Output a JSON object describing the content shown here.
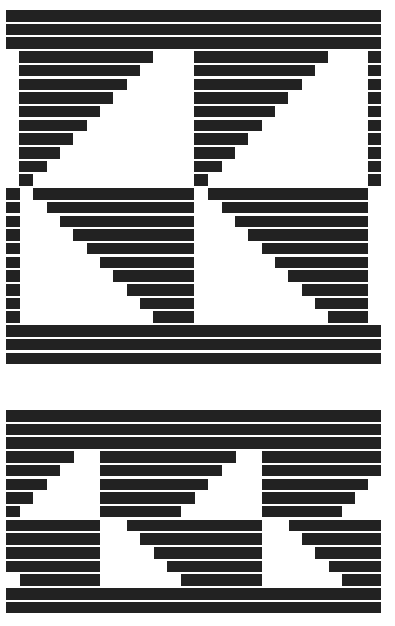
{
  "artwork": {
    "bar_color": "#222222",
    "background": "#ffffff",
    "bar_height": 11.6,
    "row_pitch": 13.7,
    "blocks": [
      {
        "name": "top-pattern",
        "top": 10,
        "rows": [
          [
            [
              6,
              381
            ]
          ],
          [
            [
              6,
              381
            ]
          ],
          [
            [
              6,
              381
            ]
          ],
          [
            [
              19,
              153
            ],
            [
              194,
              328
            ],
            [
              368,
              381
            ]
          ],
          [
            [
              19,
              140
            ],
            [
              194,
              315
            ],
            [
              368,
              381
            ]
          ],
          [
            [
              19,
              127
            ],
            [
              194,
              302
            ],
            [
              368,
              381
            ]
          ],
          [
            [
              19,
              113
            ],
            [
              194,
              288
            ],
            [
              368,
              381
            ]
          ],
          [
            [
              19,
              100
            ],
            [
              194,
              275
            ],
            [
              368,
              381
            ]
          ],
          [
            [
              19,
              87
            ],
            [
              194,
              262
            ],
            [
              368,
              381
            ]
          ],
          [
            [
              19,
              73
            ],
            [
              194,
              248
            ],
            [
              368,
              381
            ]
          ],
          [
            [
              19,
              60
            ],
            [
              194,
              235
            ],
            [
              368,
              381
            ]
          ],
          [
            [
              19,
              47
            ],
            [
              194,
              222
            ],
            [
              368,
              381
            ]
          ],
          [
            [
              19,
              33
            ],
            [
              194,
              208
            ],
            [
              368,
              381
            ]
          ],
          [
            [
              6,
              20
            ],
            [
              33,
              194
            ],
            [
              208,
              368
            ]
          ],
          [
            [
              6,
              20
            ],
            [
              47,
              194
            ],
            [
              222,
              368
            ]
          ],
          [
            [
              6,
              20
            ],
            [
              60,
              194
            ],
            [
              235,
              368
            ]
          ],
          [
            [
              6,
              20
            ],
            [
              73,
              194
            ],
            [
              248,
              368
            ]
          ],
          [
            [
              6,
              20
            ],
            [
              87,
              194
            ],
            [
              262,
              368
            ]
          ],
          [
            [
              6,
              20
            ],
            [
              100,
              194
            ],
            [
              275,
              368
            ]
          ],
          [
            [
              6,
              20
            ],
            [
              113,
              194
            ],
            [
              288,
              368
            ]
          ],
          [
            [
              6,
              20
            ],
            [
              127,
              194
            ],
            [
              302,
              368
            ]
          ],
          [
            [
              6,
              20
            ],
            [
              140,
              194
            ],
            [
              315,
              368
            ]
          ],
          [
            [
              6,
              20
            ],
            [
              153,
              194
            ],
            [
              328,
              368
            ]
          ],
          [
            [
              6,
              381
            ]
          ],
          [
            [
              6,
              381
            ]
          ],
          [
            [
              6,
              381
            ]
          ]
        ]
      },
      {
        "name": "bottom-pattern",
        "top": 410,
        "rows": [
          [
            [
              6,
              381
            ]
          ],
          [
            [
              6,
              381
            ]
          ],
          [
            [
              6,
              381
            ]
          ],
          [
            [
              6,
              74
            ],
            [
              100,
              236
            ],
            [
              262,
              381
            ]
          ],
          [
            [
              6,
              60
            ],
            [
              100,
              222
            ],
            [
              262,
              381
            ]
          ],
          [
            [
              6,
              47
            ],
            [
              100,
              208
            ],
            [
              262,
              368
            ]
          ],
          [
            [
              6,
              33
            ],
            [
              100,
              195
            ],
            [
              262,
              355
            ]
          ],
          [
            [
              6,
              20
            ],
            [
              100,
              181
            ],
            [
              262,
              342
            ]
          ],
          [
            [
              6,
              100
            ],
            [
              127,
              262
            ],
            [
              289,
              381
            ]
          ],
          [
            [
              6,
              100
            ],
            [
              140,
              262
            ],
            [
              302,
              381
            ]
          ],
          [
            [
              6,
              100
            ],
            [
              154,
              262
            ],
            [
              315,
              381
            ]
          ],
          [
            [
              6,
              100
            ],
            [
              167,
              262
            ],
            [
              329,
              381
            ]
          ],
          [
            [
              20,
              100
            ],
            [
              181,
              262
            ],
            [
              342,
              381
            ]
          ],
          [
            [
              6,
              381
            ]
          ],
          [
            [
              6,
              381
            ]
          ]
        ]
      }
    ]
  }
}
